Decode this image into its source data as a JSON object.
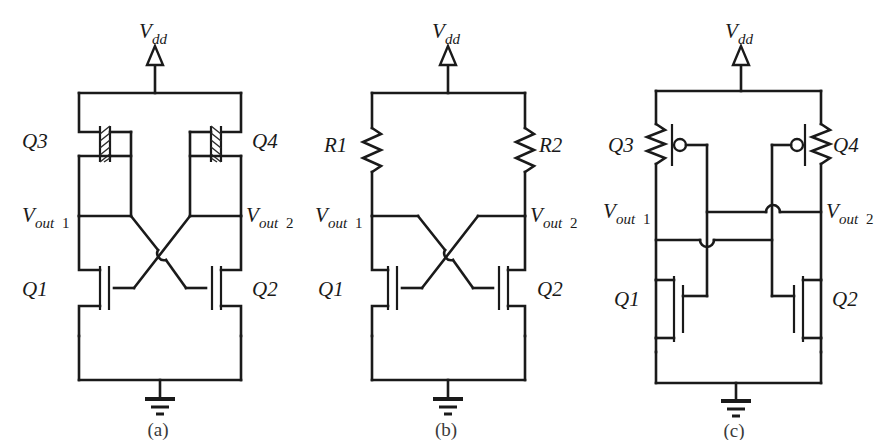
{
  "figure": {
    "kind": "circuit-schematic-figure",
    "background_color": "#ffffff",
    "line_color": "#1a1a1a",
    "panel_count": 3
  },
  "labels": {
    "vdd_v": "V",
    "vdd_sub": "dd",
    "vout_v": "V",
    "vout_sub": "out",
    "vout1_num": "1",
    "vout2_num": "2",
    "q1": "Q1",
    "q2": "Q2",
    "q3": "Q3",
    "q4": "Q4",
    "r1": "R1",
    "r2": "R2"
  },
  "panels": [
    {
      "id": "a",
      "caption": "(a)",
      "supply": "Vdd",
      "ground": "gnd",
      "load_devices": [
        "Q3",
        "Q4"
      ],
      "load_type": "depletion-mode-mosfet",
      "driver_devices": [
        "Q1",
        "Q2"
      ],
      "driver_type": "enhancement-nmos",
      "outputs": [
        "Vout1",
        "Vout2"
      ],
      "coupling": "cross-coupled"
    },
    {
      "id": "b",
      "caption": "(b)",
      "supply": "Vdd",
      "ground": "gnd",
      "load_devices": [
        "R1",
        "R2"
      ],
      "load_type": "resistor",
      "driver_devices": [
        "Q1",
        "Q2"
      ],
      "driver_type": "enhancement-nmos",
      "outputs": [
        "Vout1",
        "Vout2"
      ],
      "coupling": "cross-coupled"
    },
    {
      "id": "c",
      "caption": "(c)",
      "supply": "Vdd",
      "ground": "gnd",
      "load_devices": [
        "Q3",
        "Q4"
      ],
      "load_type": "pmos-with-series-resistor",
      "driver_devices": [
        "Q1",
        "Q2"
      ],
      "driver_type": "enhancement-nmos",
      "outputs": [
        "Vout1",
        "Vout2"
      ],
      "coupling": "cross-coupled-with-wire-hops"
    }
  ]
}
